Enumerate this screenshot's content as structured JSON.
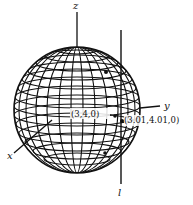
{
  "diagram": {
    "type": "3d-sphere-with-tangent-line",
    "axes": {
      "z_label": "z",
      "y_label": "y",
      "x_label": "x"
    },
    "line_label": "l",
    "points": [
      {
        "label": "(3,4,0)"
      },
      {
        "label": "(3.01,4.01,0)"
      }
    ],
    "colors": {
      "ink": "#111111",
      "background": "#ffffff"
    }
  }
}
